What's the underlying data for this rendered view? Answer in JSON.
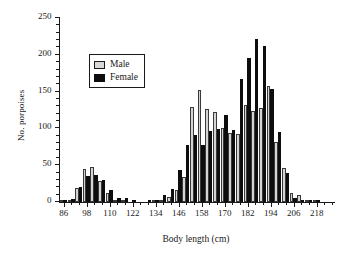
{
  "chart_data": {
    "type": "bar",
    "title": "",
    "xlabel": "Body length (cm)",
    "ylabel": "No. porpoises",
    "xlim": [
      84,
      226
    ],
    "ylim": [
      0,
      250
    ],
    "ytick_values": [
      0,
      50,
      100,
      150,
      200,
      250
    ],
    "ytick_labels": [
      "0",
      "50",
      "100",
      "150",
      "200",
      "250"
    ],
    "ytick_minor_step": 10,
    "xtick_labeled_values": [
      86,
      98,
      110,
      122,
      134,
      146,
      158,
      170,
      182,
      194,
      206,
      218
    ],
    "xtick_labels": [
      "86",
      "98",
      "110",
      "122",
      "134",
      "146",
      "158",
      "170",
      "182",
      "194",
      "206",
      "218"
    ],
    "xtick_minor_step": 4,
    "grid": false,
    "bin_width": 4,
    "legend_position": "upper left",
    "categories": [
      86,
      90,
      94,
      98,
      102,
      106,
      110,
      114,
      118,
      122,
      126,
      130,
      134,
      138,
      142,
      146,
      150,
      154,
      158,
      162,
      166,
      170,
      174,
      178,
      182,
      186,
      190,
      194,
      198,
      202,
      206,
      210,
      214,
      218,
      222
    ],
    "series": [
      {
        "name": "Male",
        "color": "#d4d4d4",
        "values": [
          2,
          3,
          19,
          45,
          48,
          29,
          12,
          3,
          1,
          0,
          0,
          0,
          1,
          3,
          7,
          17,
          34,
          129,
          152,
          127,
          122,
          101,
          94,
          93,
          132,
          124,
          128,
          157,
          81,
          46,
          12,
          9,
          2,
          1,
          0
        ]
      },
      {
        "name": "Female",
        "color": "#0d0d0d",
        "values": [
          3,
          4,
          20,
          36,
          37,
          30,
          16,
          6,
          6,
          1,
          0,
          1,
          2,
          9,
          18,
          43,
          77,
          91,
          78,
          97,
          99,
          118,
          98,
          167,
          196,
          222,
          212,
          154,
          95,
          40,
          5,
          2,
          1,
          1,
          0
        ]
      }
    ]
  },
  "legend": {
    "items": [
      {
        "label": "Male"
      },
      {
        "label": "Female"
      }
    ]
  }
}
